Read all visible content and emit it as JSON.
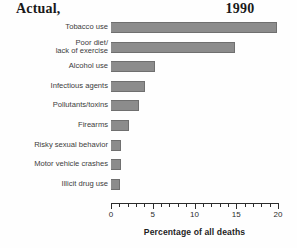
{
  "title": {
    "left": "Actual,",
    "right": "1990"
  },
  "axis": {
    "x_label": "Percentage of all deaths",
    "tick_labels": [
      "0",
      "5",
      "10",
      "15",
      "20"
    ]
  },
  "chart_data": {
    "type": "bar",
    "orientation": "horizontal",
    "title": "Actual, 1990",
    "xlabel": "Percentage of all deaths",
    "ylabel": "",
    "xlim": [
      0,
      20
    ],
    "grid": false,
    "legend": null,
    "bar_color": "#8c8c8c",
    "categories": [
      "Tobacco use",
      "Poor diet/\nlack of exercise",
      "Alcohol use",
      "Infectious agents",
      "Pollutants/toxins",
      "Firearms",
      "Risky sexual behavior",
      "Motor vehicle crashes",
      "Illicit drug use"
    ],
    "values": [
      19.9,
      14.8,
      5.3,
      4.1,
      3.3,
      2.1,
      1.2,
      1.2,
      1.1
    ],
    "major_ticks": [
      0,
      5,
      10,
      15,
      20
    ],
    "minor_tick_interval": 1
  }
}
